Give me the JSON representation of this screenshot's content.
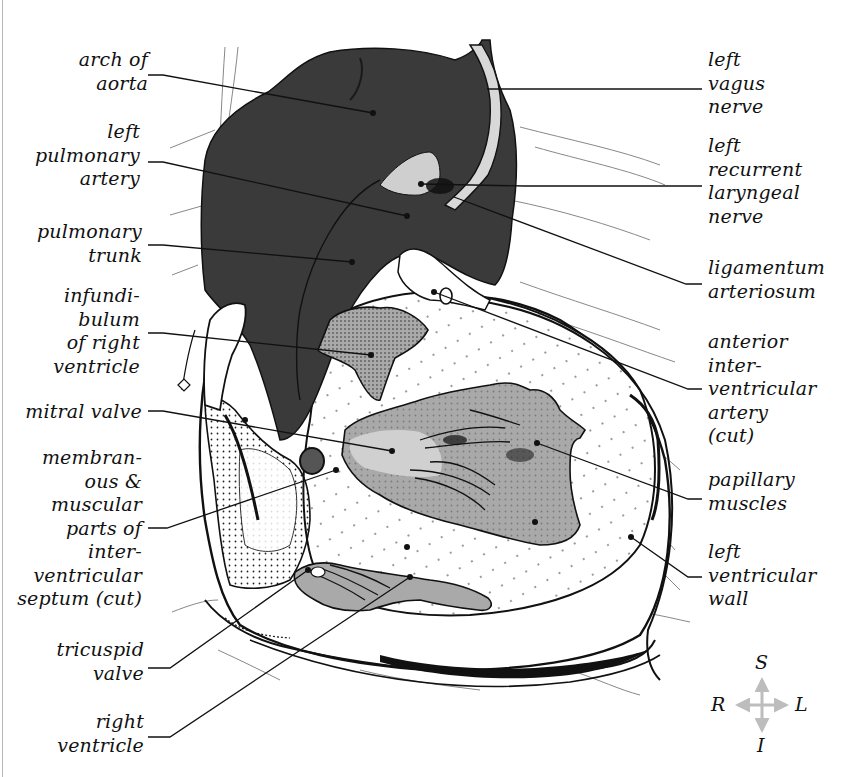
{
  "figure": {
    "colors": {
      "background": "#ffffff",
      "great_vessels_dark": "#3a3a3a",
      "tissue_mid_gray": "#a9a9a9",
      "tissue_light_gray": "#cfcfcf",
      "outline": "#111111",
      "compass_arrow": "#bdbdbd"
    }
  },
  "labels_left": [
    {
      "id": "arch-of-aorta",
      "text": "arch of\naorta",
      "x": 150,
      "y": 48,
      "w": 130
    },
    {
      "id": "left-pulmonary-artery",
      "text": "left\npulmonary\nartery",
      "x": 40,
      "y": 120,
      "w": 100
    },
    {
      "id": "pulmonary-trunk",
      "text": "pulmonary\ntrunk",
      "x": 40,
      "y": 220,
      "w": 102
    },
    {
      "id": "infundibulum-of-right-ventricle",
      "text": "infundi-\nbulum\nof right\nventricle",
      "x": 40,
      "y": 284,
      "w": 100
    },
    {
      "id": "mitral-valve",
      "text": "mitral valve",
      "x": 10,
      "y": 400,
      "w": 132
    },
    {
      "id": "membranous-muscular-interventricular-septum",
      "text": "membran-\nous &\nmuscular\nparts of\ninter-\nventricular\nseptum (cut)",
      "x": 10,
      "y": 446,
      "w": 134
    },
    {
      "id": "tricuspid-valve",
      "text": "tricuspid\nvalve",
      "x": 40,
      "y": 638,
      "w": 104
    },
    {
      "id": "right-ventricle",
      "text": "right\nventricle",
      "x": 40,
      "y": 710,
      "w": 104
    }
  ],
  "labels_right": [
    {
      "id": "left-vagus-nerve",
      "text": "left\nvagus\nnerve",
      "x": 708,
      "y": 48
    },
    {
      "id": "left-recurrent-laryngeal-nerve",
      "text": "left\nrecurrent\nlaryngeal\nnerve",
      "x": 708,
      "y": 134
    },
    {
      "id": "ligamentum-arteriosum",
      "text": "ligamentum\narteriosum",
      "x": 708,
      "y": 256
    },
    {
      "id": "anterior-interventricular-artery",
      "text": "anterior\ninter-\nventricular\nartery\n(cut)",
      "x": 708,
      "y": 330
    },
    {
      "id": "papillary-muscles",
      "text": "papillary\nmuscles",
      "x": 708,
      "y": 468
    },
    {
      "id": "left-ventricular-wall",
      "text": "left\nventricular\nwall",
      "x": 708,
      "y": 540
    }
  ],
  "leader_lines": [
    {
      "id": "arch-of-aorta",
      "points": "148,75 163,75 373,113"
    },
    {
      "id": "left-pulmonary-artery",
      "points": "148,162 163,162 407,216"
    },
    {
      "id": "pulmonary-trunk",
      "points": "148,245 163,245 352,262"
    },
    {
      "id": "infundibulum-of-right-ventricle",
      "points": "148,333 163,333 371,355"
    },
    {
      "id": "mitral-valve",
      "points": "148,411 163,411 392,451"
    },
    {
      "id": "septum",
      "points": "148,528 167,528 336,470"
    },
    {
      "id": "tricuspid-valve",
      "points": "148,668 170,668 308,570"
    },
    {
      "id": "right-ventricle",
      "points": "148,737 170,737 410,577"
    },
    {
      "id": "left-vagus-nerve",
      "points": "702,89 487,89"
    },
    {
      "id": "left-recurrent-laryngeal-nerve",
      "points": "702,186 524,186 421,184"
    },
    {
      "id": "ligamentum-arteriosum",
      "points": "702,284 686,284 454,197"
    },
    {
      "id": "anterior-interventricular-artery",
      "points": "702,389 688,389 434,292"
    },
    {
      "id": "papillary-muscles",
      "points": "702,499 688,499 537,443"
    },
    {
      "id": "left-ventricular-wall",
      "points": "702,577 688,577 631,537"
    }
  ],
  "pointer_dots": [
    {
      "x": 373,
      "y": 113
    },
    {
      "x": 407,
      "y": 216
    },
    {
      "x": 352,
      "y": 262
    },
    {
      "x": 371,
      "y": 355
    },
    {
      "x": 392,
      "y": 451
    },
    {
      "x": 407,
      "y": 547
    },
    {
      "x": 336,
      "y": 470
    },
    {
      "x": 308,
      "y": 570
    },
    {
      "x": 410,
      "y": 577
    },
    {
      "x": 421,
      "y": 184
    },
    {
      "x": 434,
      "y": 292
    },
    {
      "x": 537,
      "y": 443
    },
    {
      "x": 535,
      "y": 522
    },
    {
      "x": 631,
      "y": 537
    }
  ],
  "compass": {
    "superior": "S",
    "inferior": "I",
    "right": "R",
    "left": "L",
    "center_x": 762,
    "center_y": 705
  }
}
